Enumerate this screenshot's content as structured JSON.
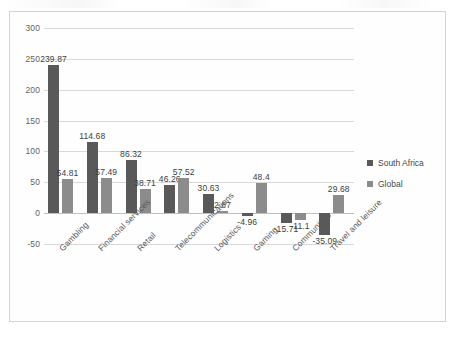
{
  "chart_data": {
    "type": "bar",
    "title": "",
    "subtitle": "",
    "xlabel": "",
    "ylabel": "",
    "ylim": [
      -50,
      300
    ],
    "ytick_step": 50,
    "yticks": [
      "300",
      "250",
      "200",
      "150",
      "100",
      "50",
      "0",
      "-50"
    ],
    "grid": true,
    "legend_position": "right",
    "categories": [
      "Gambling",
      "Financial services",
      "Retail",
      "Telecommunications",
      "Logistics",
      "Gaming",
      "Communities",
      "Travel and leisure"
    ],
    "series": [
      {
        "name": "South Africa",
        "color": "#595959",
        "values": [
          239.87,
          114.68,
          86.32,
          46.26,
          30.63,
          -4.96,
          -15.71,
          -35.09
        ],
        "labels": [
          "239.87",
          "114.68",
          "86.32",
          "46.26",
          "30.63",
          "-4.96",
          "-15.71",
          "-35.09"
        ]
      },
      {
        "name": "Global",
        "color": "#8c8c8c",
        "values": [
          54.81,
          57.49,
          38.71,
          57.52,
          2.87,
          48.4,
          -11.1,
          29.68
        ],
        "labels": [
          "54.81",
          "57.49",
          "38.71",
          "57.52",
          "2.87",
          "48.4",
          "-11.1",
          "29.68"
        ]
      }
    ]
  },
  "legend": {
    "items": [
      {
        "label": "South Africa"
      },
      {
        "label": "Global"
      }
    ]
  }
}
